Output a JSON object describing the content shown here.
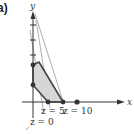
{
  "figure": {
    "part_label": "a)",
    "x_axis_label": "x",
    "y_axis_label": "y",
    "objective_lines": [
      {
        "label": "z = 0"
      },
      {
        "label": "z = 5"
      },
      {
        "label": "z = 10"
      }
    ],
    "colors": {
      "region_fill": "#d9d9d9",
      "region_edge": "#555555",
      "axis": "#333333",
      "guide_line": "#999999",
      "point": "#333333"
    }
  }
}
